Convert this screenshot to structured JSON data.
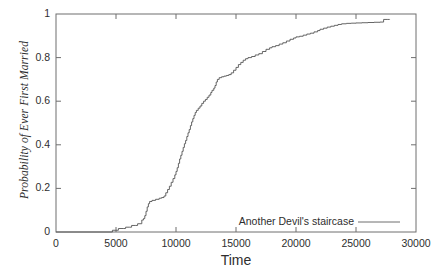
{
  "chart_data": {
    "type": "line",
    "title": "",
    "xlabel": "Time",
    "ylabel": "Probability of Ever First Married",
    "xlim": [
      0,
      30000
    ],
    "ylim": [
      0,
      1
    ],
    "grid": false,
    "legend_position": "bottom-right",
    "x_ticks": [
      0,
      5000,
      10000,
      15000,
      20000,
      25000,
      30000
    ],
    "x_tick_labels": [
      "0",
      "5000",
      "10000",
      "15000",
      "20000",
      "25000",
      "30000"
    ],
    "y_ticks": [
      0,
      0.2,
      0.4,
      0.6,
      0.8,
      1
    ],
    "y_tick_labels": [
      "0",
      "0.2",
      "0.4",
      "0.6",
      "0.8",
      "1"
    ],
    "series": [
      {
        "name": "Another Devil's staircase",
        "color": "#555555",
        "style": "step",
        "points": [
          [
            0,
            0.0
          ],
          [
            4600,
            0.0
          ],
          [
            4700,
            0.008
          ],
          [
            5000,
            0.008
          ],
          [
            5200,
            0.016
          ],
          [
            5600,
            0.016
          ],
          [
            5800,
            0.022
          ],
          [
            6100,
            0.022
          ],
          [
            6300,
            0.03
          ],
          [
            6600,
            0.03
          ],
          [
            6800,
            0.038
          ],
          [
            7000,
            0.038
          ],
          [
            7150,
            0.055
          ],
          [
            7300,
            0.062
          ],
          [
            7400,
            0.075
          ],
          [
            7500,
            0.095
          ],
          [
            7600,
            0.115
          ],
          [
            7700,
            0.13
          ],
          [
            7800,
            0.14
          ],
          [
            8000,
            0.145
          ],
          [
            8300,
            0.15
          ],
          [
            8600,
            0.155
          ],
          [
            8800,
            0.158
          ],
          [
            9000,
            0.165
          ],
          [
            9150,
            0.18
          ],
          [
            9300,
            0.195
          ],
          [
            9450,
            0.21
          ],
          [
            9600,
            0.228
          ],
          [
            9750,
            0.245
          ],
          [
            9900,
            0.262
          ],
          [
            10000,
            0.278
          ],
          [
            10100,
            0.295
          ],
          [
            10200,
            0.315
          ],
          [
            10300,
            0.335
          ],
          [
            10400,
            0.352
          ],
          [
            10500,
            0.37
          ],
          [
            10600,
            0.388
          ],
          [
            10700,
            0.405
          ],
          [
            10800,
            0.42
          ],
          [
            10900,
            0.438
          ],
          [
            11000,
            0.455
          ],
          [
            11100,
            0.47
          ],
          [
            11200,
            0.488
          ],
          [
            11300,
            0.505
          ],
          [
            11400,
            0.52
          ],
          [
            11500,
            0.535
          ],
          [
            11600,
            0.548
          ],
          [
            11700,
            0.558
          ],
          [
            11850,
            0.568
          ],
          [
            12000,
            0.578
          ],
          [
            12150,
            0.59
          ],
          [
            12300,
            0.6
          ],
          [
            12450,
            0.608
          ],
          [
            12600,
            0.618
          ],
          [
            12750,
            0.628
          ],
          [
            12900,
            0.64
          ],
          [
            13000,
            0.65
          ],
          [
            13150,
            0.66
          ],
          [
            13250,
            0.672
          ],
          [
            13350,
            0.688
          ],
          [
            13450,
            0.7
          ],
          [
            13600,
            0.708
          ],
          [
            13800,
            0.712
          ],
          [
            14000,
            0.715
          ],
          [
            14200,
            0.718
          ],
          [
            14400,
            0.722
          ],
          [
            14600,
            0.73
          ],
          [
            14800,
            0.742
          ],
          [
            15000,
            0.755
          ],
          [
            15200,
            0.768
          ],
          [
            15400,
            0.778
          ],
          [
            15600,
            0.788
          ],
          [
            15800,
            0.795
          ],
          [
            16000,
            0.8
          ],
          [
            16300,
            0.805
          ],
          [
            16600,
            0.812
          ],
          [
            16900,
            0.818
          ],
          [
            17200,
            0.828
          ],
          [
            17500,
            0.838
          ],
          [
            17800,
            0.845
          ],
          [
            18000,
            0.85
          ],
          [
            18300,
            0.855
          ],
          [
            18600,
            0.862
          ],
          [
            18900,
            0.868
          ],
          [
            19200,
            0.876
          ],
          [
            19500,
            0.884
          ],
          [
            19800,
            0.89
          ],
          [
            20000,
            0.895
          ],
          [
            20300,
            0.898
          ],
          [
            20600,
            0.903
          ],
          [
            20900,
            0.908
          ],
          [
            21200,
            0.912
          ],
          [
            21500,
            0.918
          ],
          [
            21800,
            0.924
          ],
          [
            22000,
            0.93
          ],
          [
            22300,
            0.935
          ],
          [
            22600,
            0.94
          ],
          [
            22900,
            0.944
          ],
          [
            23200,
            0.948
          ],
          [
            23500,
            0.952
          ],
          [
            23800,
            0.955
          ],
          [
            24200,
            0.957
          ],
          [
            24600,
            0.958
          ],
          [
            25000,
            0.959
          ],
          [
            25500,
            0.96
          ],
          [
            26000,
            0.961
          ],
          [
            26500,
            0.962
          ],
          [
            27000,
            0.963
          ],
          [
            27300,
            0.975
          ],
          [
            27600,
            0.975
          ],
          [
            27800,
            0.976
          ]
        ]
      }
    ]
  },
  "legend": {
    "entries": [
      {
        "label": "Another Devil's staircase"
      }
    ]
  },
  "axes": {
    "x_title": "Time",
    "y_title": "Probability of Ever First Married"
  }
}
